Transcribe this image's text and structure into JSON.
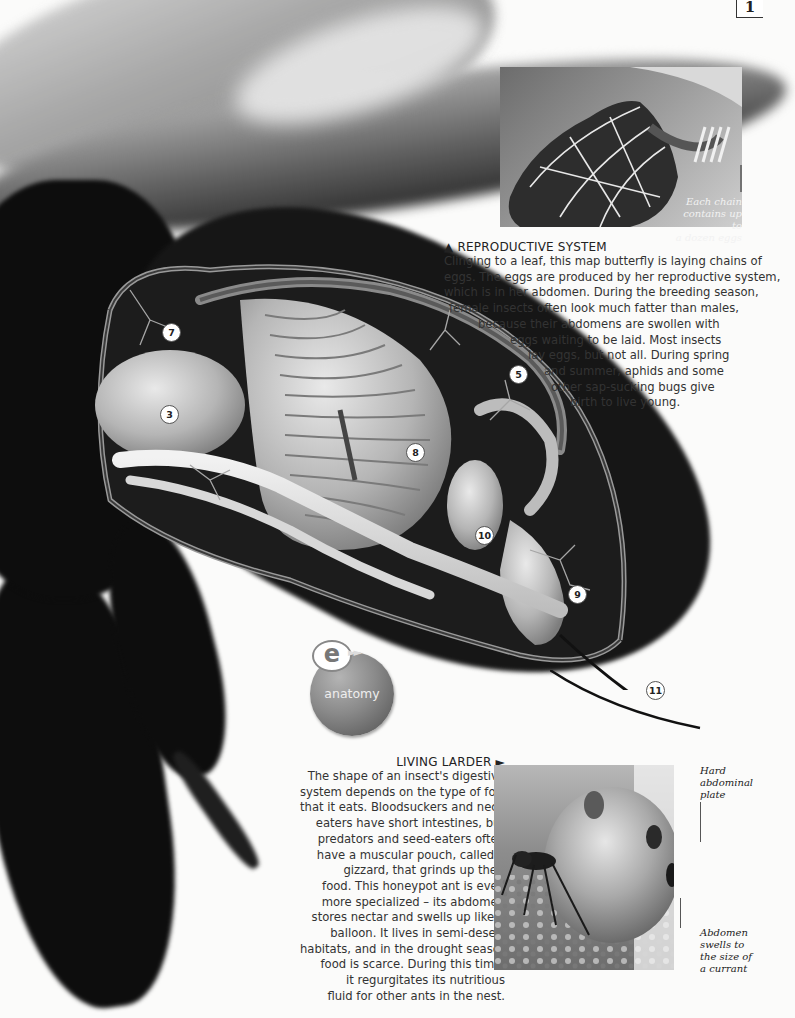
{
  "page": {
    "number": "1"
  },
  "illustration": {
    "subject": "insect abdomen cutaway",
    "callouts": [
      {
        "id": "3",
        "label": "3"
      },
      {
        "id": "5",
        "label": "5"
      },
      {
        "id": "7",
        "label": "7"
      },
      {
        "id": "8",
        "label": "8"
      },
      {
        "id": "9",
        "label": "9"
      },
      {
        "id": "10",
        "label": "10"
      },
      {
        "id": "11",
        "label": "11"
      }
    ]
  },
  "badge": {
    "letter": "e",
    "arrows": "►►",
    "label": "anatomy"
  },
  "reproductive": {
    "marker": "▲",
    "heading": "REPRODUCTIVE SYSTEM",
    "lines": [
      "Clinging to a leaf, this map butterfly is laying chains of",
      "eggs. The eggs are produced by her reproductive system,",
      "which is in her abdomen. During the breeding season,",
      "female insects often look much fatter than males,",
      "because their abdomens are swollen with",
      "eggs waiting to be laid. Most insects",
      "lay eggs, but not all. During spring",
      "and summer, aphids and some",
      "other sap-sucking bugs give",
      "birth to live young."
    ],
    "photo_caption": [
      "Each chain",
      "contains up to",
      "a dozen eggs"
    ]
  },
  "larder": {
    "heading": "LIVING LARDER",
    "marker": "►",
    "lines": [
      "The shape of an insect's digestive",
      "system depends on the type of food",
      "that it eats. Bloodsuckers and nectar-",
      "eaters have short intestines, but",
      "predators and seed-eaters often",
      "have a muscular pouch, called a",
      "gizzard, that grinds up their",
      "food. This honeypot ant is even",
      "more specialized – its abdomen",
      "stores nectar and swells up like a",
      "balloon. It lives in semi-desert",
      "habitats, and in the drought season",
      "food is scarce. During this time,",
      "it regurgitates its nutritious",
      "fluid for other ants in the nest."
    ],
    "caption_plate": [
      "Hard",
      "abdominal",
      "plate"
    ],
    "caption_abdomen": [
      "Abdomen",
      "swells to",
      "the size of",
      "a currant"
    ]
  }
}
